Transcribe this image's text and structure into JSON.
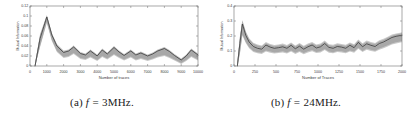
{
  "figure": {
    "background": "#ffffff",
    "panels": [
      {
        "caption_label": "(a)",
        "caption_var": "f",
        "caption_eq": "=",
        "caption_value": "3MHz.",
        "caption_full": "(a) f = 3MHz."
      },
      {
        "caption_label": "(b)",
        "caption_var": "f",
        "caption_eq": "=",
        "caption_value": "24MHz.",
        "caption_full": "(b) f = 24MHz."
      }
    ]
  },
  "colors": {
    "line": "#3a3a3a",
    "band": "#c9c9c9",
    "band_inner": "#a8a8a8",
    "axis": "#6e6e6e",
    "tick_text": "#3a3a3a",
    "background": "#ffffff"
  },
  "chart_data": [
    {
      "type": "line",
      "title": "",
      "xlabel": "Number of traces",
      "ylabel": "Mutual Information",
      "xlim": [
        0,
        10000
      ],
      "ylim": [
        0,
        0.12
      ],
      "grid": false,
      "legend": null,
      "xticks": [
        0,
        1000,
        2000,
        3000,
        4000,
        5000,
        6000,
        7000,
        8000,
        9000,
        10000
      ],
      "xticklabels": [
        "0",
        "1000",
        "2000",
        "3000",
        "4000",
        "5000",
        "6000",
        "7000",
        "8000",
        "9000",
        "10000"
      ],
      "yticks": [
        0,
        0.02,
        0.04,
        0.06,
        0.08,
        0.1,
        0.12
      ],
      "yticklabels": [
        "0",
        "0.02",
        "0.04",
        "0.06",
        "0.08",
        "0.1",
        "0.12"
      ],
      "x": [
        300,
        600,
        1000,
        1300,
        1600,
        2000,
        2300,
        2600,
        3000,
        3300,
        3600,
        4000,
        4300,
        4600,
        5000,
        5300,
        5600,
        6000,
        6300,
        6600,
        7000,
        7300,
        7600,
        8000,
        8300,
        8600,
        9000,
        9300,
        9600,
        10000
      ],
      "series": [
        {
          "name": "mean",
          "values": [
            0.0,
            0.055,
            0.098,
            0.062,
            0.04,
            0.027,
            0.03,
            0.038,
            0.025,
            0.022,
            0.03,
            0.02,
            0.032,
            0.024,
            0.037,
            0.028,
            0.021,
            0.03,
            0.022,
            0.026,
            0.02,
            0.024,
            0.03,
            0.035,
            0.029,
            0.021,
            0.012,
            0.02,
            0.032,
            0.022
          ]
        },
        {
          "name": "band_upper",
          "values": [
            0.004,
            0.062,
            0.1,
            0.064,
            0.042,
            0.029,
            0.031,
            0.039,
            0.026,
            0.023,
            0.031,
            0.021,
            0.033,
            0.025,
            0.038,
            0.029,
            0.022,
            0.031,
            0.023,
            0.027,
            0.021,
            0.025,
            0.031,
            0.036,
            0.03,
            0.022,
            0.013,
            0.021,
            0.033,
            0.023
          ]
        },
        {
          "name": "band_lower",
          "values": [
            0.0,
            0.04,
            0.088,
            0.052,
            0.03,
            0.018,
            0.02,
            0.026,
            0.016,
            0.014,
            0.019,
            0.012,
            0.02,
            0.015,
            0.024,
            0.018,
            0.013,
            0.019,
            0.013,
            0.016,
            0.012,
            0.015,
            0.019,
            0.022,
            0.018,
            0.013,
            0.006,
            0.012,
            0.02,
            0.013
          ]
        }
      ]
    },
    {
      "type": "line",
      "title": "",
      "xlabel": "Number of Traces",
      "ylabel": "Mutual Information",
      "xlim": [
        0,
        2000
      ],
      "ylim": [
        0,
        0.4
      ],
      "grid": false,
      "legend": null,
      "xticks": [
        0,
        250,
        500,
        750,
        1000,
        1250,
        1500,
        1750,
        2000
      ],
      "xticklabels": [
        "0",
        "250",
        "500",
        "750",
        "1000",
        "1250",
        "1500",
        "1750",
        "2000"
      ],
      "yticks": [
        0,
        0.1,
        0.2,
        0.3,
        0.4
      ],
      "yticklabels": [
        "0",
        "0.1",
        "0.2",
        "0.3",
        "0.4"
      ],
      "x": [
        40,
        70,
        100,
        140,
        180,
        230,
        280,
        330,
        380,
        430,
        480,
        530,
        580,
        630,
        680,
        730,
        780,
        830,
        880,
        930,
        980,
        1030,
        1080,
        1130,
        1180,
        1230,
        1280,
        1330,
        1380,
        1430,
        1480,
        1530,
        1580,
        1630,
        1680,
        1730,
        1780,
        1830,
        1880,
        1930,
        1980,
        2000
      ],
      "series": [
        {
          "name": "mean",
          "values": [
            0.0,
            0.15,
            0.28,
            0.205,
            0.16,
            0.13,
            0.118,
            0.112,
            0.14,
            0.126,
            0.118,
            0.122,
            0.128,
            0.118,
            0.138,
            0.115,
            0.132,
            0.112,
            0.128,
            0.14,
            0.12,
            0.128,
            0.15,
            0.124,
            0.118,
            0.13,
            0.126,
            0.118,
            0.138,
            0.122,
            0.158,
            0.128,
            0.148,
            0.138,
            0.13,
            0.15,
            0.16,
            0.175,
            0.19,
            0.198,
            0.203,
            0.205
          ]
        },
        {
          "name": "band_upper",
          "values": [
            0.02,
            0.19,
            0.3,
            0.225,
            0.178,
            0.148,
            0.136,
            0.13,
            0.152,
            0.14,
            0.132,
            0.136,
            0.142,
            0.132,
            0.15,
            0.13,
            0.146,
            0.128,
            0.142,
            0.152,
            0.136,
            0.142,
            0.162,
            0.138,
            0.134,
            0.144,
            0.14,
            0.134,
            0.15,
            0.138,
            0.17,
            0.144,
            0.162,
            0.152,
            0.146,
            0.164,
            0.174,
            0.188,
            0.202,
            0.21,
            0.215,
            0.218
          ]
        },
        {
          "name": "band_lower",
          "values": [
            0.0,
            0.085,
            0.21,
            0.16,
            0.125,
            0.1,
            0.092,
            0.088,
            0.104,
            0.096,
            0.09,
            0.094,
            0.098,
            0.09,
            0.104,
            0.088,
            0.1,
            0.086,
            0.098,
            0.106,
            0.094,
            0.098,
            0.114,
            0.096,
            0.092,
            0.1,
            0.098,
            0.092,
            0.104,
            0.096,
            0.122,
            0.1,
            0.116,
            0.108,
            0.102,
            0.116,
            0.126,
            0.138,
            0.15,
            0.158,
            0.164,
            0.166
          ]
        }
      ]
    }
  ]
}
